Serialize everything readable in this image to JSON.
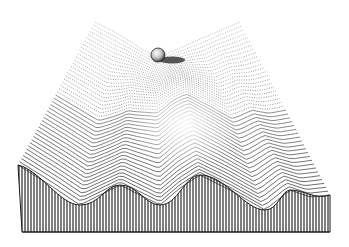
{
  "illustration": {
    "description": "Engraved line illustration of a 3D energy landscape surface with a ball resting in a saddle/valley near the top",
    "style": "stippled engraving, black ink on white",
    "colors": {
      "background": "#ffffff",
      "ink": "#1a1a1a",
      "shade": "#555555"
    },
    "elements": {
      "surface": "wavy-surface",
      "front_cross_section": "hatched-front-face",
      "ball": "sphere"
    }
  }
}
